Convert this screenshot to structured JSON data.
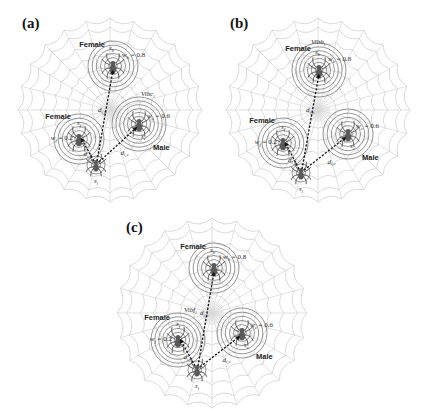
{
  "figure": {
    "panels": [
      {
        "id": "a",
        "label": "(a)",
        "vibration_label": "Vibc",
        "vibration_sub": "i",
        "distance_center_label": "d",
        "distance_center_sub": "i,b",
        "distance_right_label": "d",
        "distance_right_sub": "i,c",
        "distance_left_label": "d",
        "distance_left_sub": "i,f",
        "spiders": {
          "top": {
            "sex": "Female",
            "id_label": "s",
            "id_sub": "b",
            "weight_label": "w",
            "weight_sub": "b",
            "weight_value": "= 0.8"
          },
          "right": {
            "sex": "Male",
            "id_label": "s",
            "id_sub": "c",
            "weight_label": "w",
            "weight_sub": "c",
            "weight_value": "= 0.6"
          },
          "left": {
            "sex": "Female",
            "id_label": "s",
            "id_sub": "f",
            "weight_label": "w",
            "weight_sub": "f",
            "weight_value": "= 0.2"
          },
          "bottom": {
            "id_label": "s",
            "id_sub": "i"
          }
        }
      },
      {
        "id": "b",
        "label": "(b)",
        "vibration_label": "Vibb",
        "vibration_sub": "i",
        "distance_center_label": "d",
        "distance_center_sub": "i,b",
        "distance_right_label": "d",
        "distance_right_sub": "i,c",
        "distance_left_label": "d",
        "distance_left_sub": "i,f",
        "spiders": {
          "top": {
            "sex": "Female",
            "id_label": "s",
            "id_sub": "b",
            "weight_label": "w",
            "weight_sub": "b",
            "weight_value": "= 0.8"
          },
          "right": {
            "sex": "Male",
            "id_label": "s",
            "id_sub": "c",
            "weight_label": "w",
            "weight_sub": "c",
            "weight_value": "= 0.6"
          },
          "left": {
            "sex": "Female",
            "id_label": "s",
            "id_sub": "f",
            "weight_label": "w",
            "weight_sub": "f",
            "weight_value": "= 0.2"
          },
          "bottom": {
            "id_label": "s",
            "id_sub": "i"
          }
        }
      },
      {
        "id": "c",
        "label": "(c)",
        "vibration_label": "Vibf",
        "vibration_sub": "i",
        "distance_center_label": "d",
        "distance_center_sub": "i,b",
        "distance_right_label": "d",
        "distance_right_sub": "i,c",
        "distance_left_label": "d",
        "distance_left_sub": "i,f",
        "spiders": {
          "top": {
            "sex": "Female",
            "id_label": "s",
            "id_sub": "b",
            "weight_label": "w",
            "weight_sub": "b",
            "weight_value": "= 0.8"
          },
          "right": {
            "sex": "Male",
            "id_label": "s",
            "id_sub": "c",
            "weight_label": "w",
            "weight_sub": "c",
            "weight_value": "= 0.6"
          },
          "left": {
            "sex": "Female",
            "id_label": "s",
            "id_sub": "f",
            "weight_label": "w",
            "weight_sub": "f",
            "weight_value": "= 0.2"
          },
          "bottom": {
            "id_label": "s",
            "id_sub": "i"
          }
        }
      }
    ],
    "vibration_source": {
      "a": "right",
      "b": "top",
      "c": "left"
    }
  }
}
